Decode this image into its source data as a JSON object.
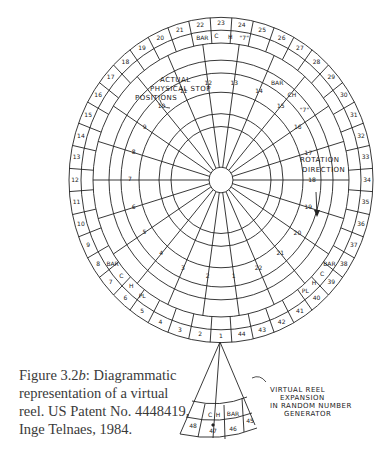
{
  "caption": {
    "figure_label": "Figure 3.2",
    "figure_suffix": "b",
    "text": ": Diagrammatic representation of a virtual reel. US Patent No. 4448419, Inge Telnaes, 1984."
  },
  "annotations": {
    "actual_stops": [
      "ACTUAL",
      "PHYSICAL STOP",
      "POSITIONS"
    ],
    "rotation": [
      "ROTATION",
      "DIRECTION"
    ],
    "virtual_expansion": [
      "VIRTUAL REEL",
      "EXPANSION",
      "IN RANDOM NUMBER",
      "GENERATOR"
    ]
  },
  "outer_ring": {
    "count": 44,
    "labels": [
      "1",
      "2",
      "3",
      "4",
      "5",
      "6",
      "7",
      "8",
      "9",
      "10",
      "11",
      "12",
      "13",
      "14",
      "15",
      "16",
      "17",
      "18",
      "19",
      "20",
      "21",
      "22",
      "23",
      "24",
      "25",
      "26",
      "27",
      "28",
      "29",
      "30",
      "31",
      "32",
      "33",
      "34",
      "35",
      "36",
      "37",
      "38",
      "39",
      "40",
      "41",
      "42",
      "43",
      "44"
    ]
  },
  "inner_ring": {
    "count": 22,
    "labels": [
      "1",
      "2",
      "3",
      "4",
      "5",
      "6",
      "7",
      "8",
      "9",
      "10",
      "11",
      "12",
      "13",
      "14",
      "15",
      "16",
      "17",
      "18",
      "19",
      "20",
      "21",
      "22"
    ]
  },
  "symbols": {
    "top": [
      "BAR",
      "C",
      "H",
      "\"7\""
    ],
    "inner": [
      "BAR",
      "CH",
      "\"7\""
    ],
    "left": [
      "BAR",
      "C",
      "H",
      "PL"
    ],
    "right": [
      "BAR",
      "C",
      "H",
      "PL"
    ],
    "wedge": [
      "C",
      "H",
      "BAR"
    ]
  },
  "wedge_labels": [
    "48",
    "47",
    "46",
    "45"
  ]
}
